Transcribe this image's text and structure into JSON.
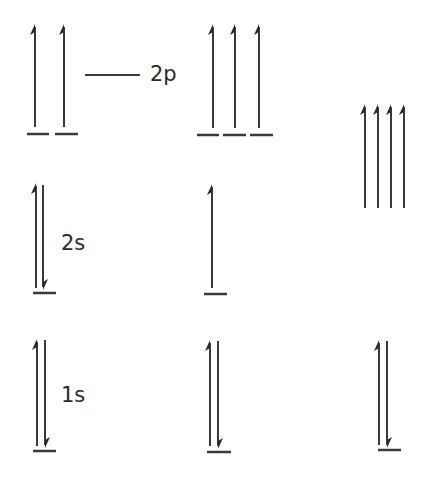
{
  "diagram": {
    "type": "orbital-energy-level-diagram",
    "colors": {
      "line": "#3a3a3a",
      "background": "#ffffff"
    },
    "labels": {
      "2p": "2p",
      "2s": "2s",
      "1s": "1s"
    },
    "columns": [
      {
        "id": "column-1",
        "orbitals": [
          {
            "name": "2p",
            "levels": 2,
            "electrons": [
              "up",
              "up"
            ]
          },
          {
            "name": "2s",
            "levels": 1,
            "electrons": [
              "up",
              "down"
            ]
          },
          {
            "name": "1s",
            "levels": 1,
            "electrons": [
              "up",
              "down"
            ]
          }
        ]
      },
      {
        "id": "column-2",
        "orbitals": [
          {
            "name": "2p",
            "levels": 3,
            "electrons": [
              "up",
              "up",
              "up"
            ]
          },
          {
            "name": "2s",
            "levels": 1,
            "electrons": [
              "up"
            ]
          },
          {
            "name": "1s",
            "levels": 1,
            "electrons": [
              "up",
              "down"
            ]
          }
        ]
      },
      {
        "id": "column-3",
        "orbitals": [
          {
            "name": "hybrid",
            "levels": 0,
            "electrons": [
              "up",
              "up",
              "up",
              "up"
            ]
          },
          {
            "name": "1s",
            "levels": 1,
            "electrons": [
              "up",
              "down"
            ]
          }
        ]
      }
    ]
  }
}
